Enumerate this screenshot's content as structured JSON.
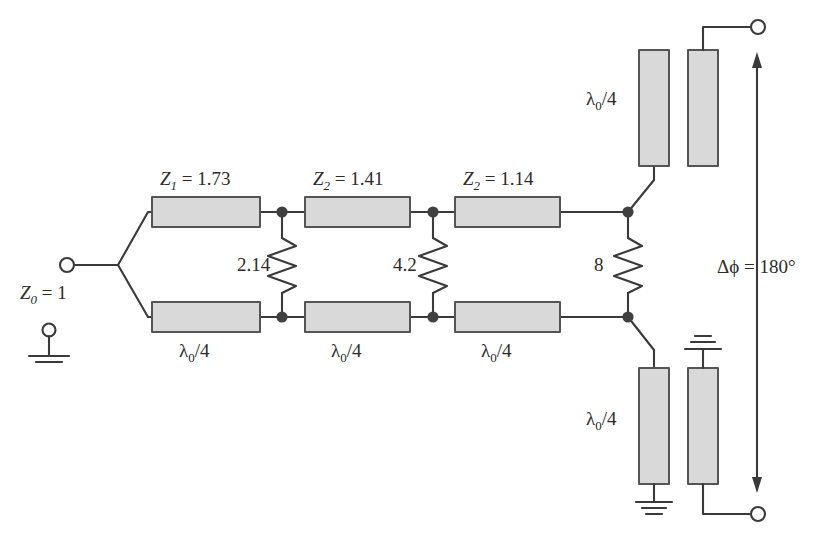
{
  "figure": {
    "type": "schematic-diagram",
    "colors": {
      "line": "#3a3a3a",
      "bar_fill": "#d9d9d9",
      "bar_stroke": "#555555",
      "node": "#404040",
      "background": "#ffffff",
      "text": "#2b2b2b"
    }
  },
  "input": {
    "port_label": "Z",
    "port_sub": "0",
    "port_value": " = 1",
    "full_label": "Z0 = 1",
    "ground_name": "ground-symbol"
  },
  "sections": [
    {
      "index": 1,
      "top_label_z": "Z",
      "top_label_sub": "1",
      "top_label_val": " = 1.73",
      "top_label_full": "Z1 = 1.73",
      "bottom_label": "λ0/4",
      "bottom_lambda": "λ",
      "bottom_sub": "0",
      "bottom_rest": "/4"
    },
    {
      "index": 2,
      "top_label_z": "Z",
      "top_label_sub": "2",
      "top_label_val": " = 1.41",
      "top_label_full": "Z2 = 1.41",
      "bottom_label": "λ0/4",
      "bottom_lambda": "λ",
      "bottom_sub": "0",
      "bottom_rest": "/4"
    },
    {
      "index": 3,
      "top_label_z": "Z",
      "top_label_sub": "2",
      "top_label_val": " = 1.14",
      "top_label_full": "Z2 = 1.14",
      "bottom_label": "λ0/4",
      "bottom_lambda": "λ",
      "bottom_sub": "0",
      "bottom_rest": "/4"
    }
  ],
  "resistors": [
    {
      "name": "resistor-1",
      "value": "2.14"
    },
    {
      "name": "resistor-2",
      "value": "4.2"
    },
    {
      "name": "resistor-3",
      "value": "8"
    }
  ],
  "output_arms": {
    "top_label_lambda": "λ",
    "top_label_sub": "0",
    "top_label_rest": "/4",
    "top_label_full": "λ0/4",
    "bottom_label_lambda": "λ",
    "bottom_label_sub": "0",
    "bottom_label_rest": "/4",
    "bottom_label_full": "λ0/4"
  },
  "phase": {
    "symbol": "Δϕ",
    "equals": " = ",
    "value": "180°",
    "full_label": "Δϕ = 180°"
  }
}
